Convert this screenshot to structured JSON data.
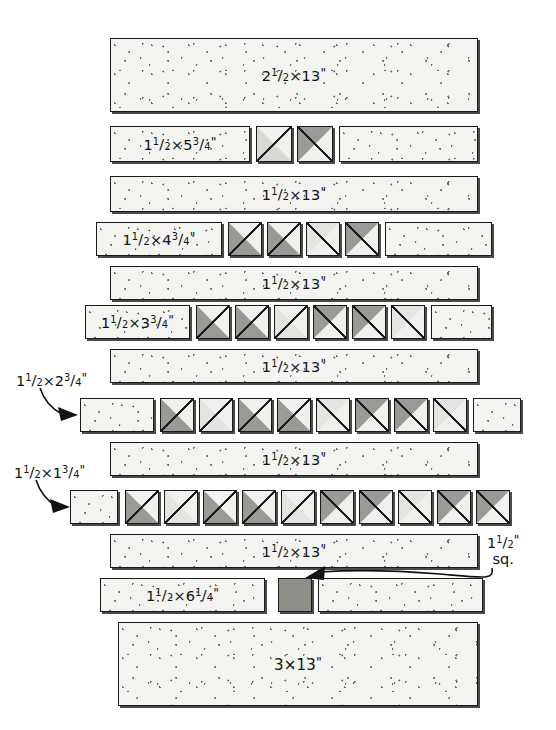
{
  "diagram": {
    "colors": {
      "fabric_light": "#f3f3f0",
      "triangle_light": "#d9d9d4",
      "triangle_dark": "#9a9a95",
      "solid_square": "#8f8f8a",
      "outline": "#1a1a1a"
    },
    "rows": [
      {
        "id": "row-1",
        "pieces": [
          {
            "type": "strip",
            "label": "2½×13\"",
            "label_parts": {
              "whole": "2",
              "num": "1",
              "den": "2",
              "rest": "×13",
              "inch": "\""
            }
          }
        ]
      },
      {
        "id": "row-2",
        "pieces": [
          {
            "type": "strip",
            "label": "1½×5¾\"",
            "label_parts": {
              "whole": "1",
              "num": "1",
              "den": "2",
              "rest": "×5",
              "num2": "3",
              "den2": "4",
              "inch": "\""
            }
          },
          {
            "type": "hst",
            "shade": "light",
            "orientation": "lower-left"
          },
          {
            "type": "hst",
            "shade": "dark",
            "orientation": "upper-left"
          },
          {
            "type": "strip",
            "label": ""
          }
        ]
      },
      {
        "id": "row-3",
        "pieces": [
          {
            "type": "strip",
            "label": "1½×13\"",
            "label_parts": {
              "whole": "1",
              "num": "1",
              "den": "2",
              "rest": "×13",
              "inch": "\""
            }
          }
        ]
      },
      {
        "id": "row-4",
        "pieces": [
          {
            "type": "strip",
            "label": "1½×4¾\"",
            "label_parts": {
              "whole": "1",
              "num": "1",
              "den": "2",
              "rest": "×4",
              "num2": "3",
              "den2": "4",
              "inch": "\""
            }
          },
          {
            "type": "hst",
            "shade": "dark",
            "orientation": "lower-left"
          },
          {
            "type": "hst",
            "shade": "dark",
            "orientation": "lower-left"
          },
          {
            "type": "hst",
            "shade": "light",
            "orientation": "upper-left"
          },
          {
            "type": "hst",
            "shade": "dark",
            "orientation": "upper-left"
          },
          {
            "type": "strip",
            "label": ""
          }
        ]
      },
      {
        "id": "row-5",
        "pieces": [
          {
            "type": "strip",
            "label": "1½×13\"",
            "label_parts": {
              "whole": "1",
              "num": "1",
              "den": "2",
              "rest": "×13",
              "inch": "\""
            }
          }
        ]
      },
      {
        "id": "row-6",
        "pieces": [
          {
            "type": "strip",
            "label": "1½×3¾\"",
            "label_parts": {
              "whole": "1",
              "num": "1",
              "den": "2",
              "rest": "×3",
              "num2": "3",
              "den2": "4",
              "inch": "\""
            }
          },
          {
            "type": "hst",
            "shade": "dark",
            "orientation": "lower-left"
          },
          {
            "type": "hst",
            "shade": "dark",
            "orientation": "lower-left"
          },
          {
            "type": "hst",
            "shade": "light",
            "orientation": "lower-left"
          },
          {
            "type": "hst",
            "shade": "dark",
            "orientation": "upper-left"
          },
          {
            "type": "hst",
            "shade": "dark",
            "orientation": "upper-left"
          },
          {
            "type": "hst",
            "shade": "light",
            "orientation": "upper-left"
          },
          {
            "type": "strip",
            "label": ""
          }
        ]
      },
      {
        "id": "row-7",
        "pieces": [
          {
            "type": "strip",
            "label": "1½×13\"",
            "label_parts": {
              "whole": "1",
              "num": "1",
              "den": "2",
              "rest": "×13",
              "inch": "\""
            }
          }
        ]
      },
      {
        "id": "row-8",
        "callout_left": "1½×2¾\"",
        "pieces": [
          {
            "type": "strip",
            "label": ""
          },
          {
            "type": "hst",
            "shade": "dark",
            "orientation": "lower-left"
          },
          {
            "type": "hst",
            "shade": "light",
            "orientation": "lower-left"
          },
          {
            "type": "hst",
            "shade": "dark",
            "orientation": "lower-left"
          },
          {
            "type": "hst",
            "shade": "dark",
            "orientation": "lower-left"
          },
          {
            "type": "hst",
            "shade": "light",
            "orientation": "upper-left"
          },
          {
            "type": "hst",
            "shade": "dark",
            "orientation": "upper-left"
          },
          {
            "type": "hst",
            "shade": "dark",
            "orientation": "upper-left"
          },
          {
            "type": "hst",
            "shade": "light",
            "orientation": "upper-left"
          },
          {
            "type": "strip",
            "label": ""
          }
        ]
      },
      {
        "id": "row-9",
        "pieces": [
          {
            "type": "strip",
            "label": "1½×13\"",
            "label_parts": {
              "whole": "1",
              "num": "1",
              "den": "2",
              "rest": "×13",
              "inch": "\""
            }
          }
        ]
      },
      {
        "id": "row-10",
        "callout_left": "1½×1¾\"",
        "pieces": [
          {
            "type": "strip",
            "label": ""
          },
          {
            "type": "hst",
            "shade": "dark",
            "orientation": "lower-left"
          },
          {
            "type": "hst",
            "shade": "light",
            "orientation": "lower-left"
          },
          {
            "type": "hst",
            "shade": "dark",
            "orientation": "lower-left"
          },
          {
            "type": "hst",
            "shade": "dark",
            "orientation": "lower-left"
          },
          {
            "type": "hst",
            "shade": "light",
            "orientation": "lower-left"
          },
          {
            "type": "hst",
            "shade": "dark",
            "orientation": "upper-left"
          },
          {
            "type": "hst",
            "shade": "dark",
            "orientation": "upper-left"
          },
          {
            "type": "hst",
            "shade": "light",
            "orientation": "upper-left"
          },
          {
            "type": "hst",
            "shade": "dark",
            "orientation": "upper-left"
          },
          {
            "type": "hst",
            "shade": "dark",
            "orientation": "upper-left"
          },
          {
            "type": "strip",
            "label": ""
          }
        ]
      },
      {
        "id": "row-11",
        "pieces": [
          {
            "type": "strip",
            "label": "1½×13\"",
            "label_parts": {
              "whole": "1",
              "num": "1",
              "den": "2",
              "rest": "×13",
              "inch": "\""
            }
          }
        ]
      },
      {
        "id": "row-12",
        "callout_right_line1": "1½\"",
        "callout_right_line2": "sq.",
        "pieces": [
          {
            "type": "strip",
            "label": "1½×6¼\"",
            "label_parts": {
              "whole": "1",
              "num": "1",
              "den": "2",
              "rest": "×6",
              "num2": "1",
              "den2": "4",
              "inch": "\""
            }
          },
          {
            "type": "solid_square",
            "label": ""
          },
          {
            "type": "strip",
            "label": ""
          }
        ]
      },
      {
        "id": "row-13",
        "pieces": [
          {
            "type": "strip",
            "label": "3×13\"",
            "label_parts": {
              "whole": "3×13",
              "inch": "\""
            }
          }
        ]
      }
    ],
    "labels": {
      "r1": {
        "whole": "2",
        "num": "1",
        "den": "2",
        "rest": "×13",
        "inch": "\""
      },
      "r2": {
        "whole": "1",
        "num": "1",
        "den": "2",
        "rest": "×5",
        "num2": "3",
        "den2": "4",
        "inch": "\""
      },
      "r3": {
        "whole": "1",
        "num": "1",
        "den": "2",
        "rest": "×13",
        "inch": "\""
      },
      "r4": {
        "whole": "1",
        "num": "1",
        "den": "2",
        "rest": "×4",
        "num2": "3",
        "den2": "4",
        "inch": "\""
      },
      "r5": {
        "whole": "1",
        "num": "1",
        "den": "2",
        "rest": "×13",
        "inch": "\""
      },
      "r6": {
        "whole": "1",
        "num": "1",
        "den": "2",
        "rest": "×3",
        "num2": "3",
        "den2": "4",
        "inch": "\""
      },
      "r7": {
        "whole": "1",
        "num": "1",
        "den": "2",
        "rest": "×13",
        "inch": "\""
      },
      "r8": {
        "whole": "1",
        "num": "1",
        "den": "2",
        "rest": "×2",
        "num2": "3",
        "den2": "4",
        "inch": "\""
      },
      "r9": {
        "whole": "1",
        "num": "1",
        "den": "2",
        "rest": "×13",
        "inch": "\""
      },
      "r10": {
        "whole": "1",
        "num": "1",
        "den": "2",
        "rest": "×1",
        "num2": "3",
        "den2": "4",
        "inch": "\""
      },
      "r11": {
        "whole": "1",
        "num": "1",
        "den": "2",
        "rest": "×13",
        "inch": "\""
      },
      "r12": {
        "whole": "1",
        "num": "1",
        "den": "2",
        "rest": "×6",
        "num2": "1",
        "den2": "4",
        "inch": "\""
      },
      "r12sq": {
        "whole": "1",
        "num": "1",
        "den": "2",
        "inch": "\"",
        "second": "sq."
      },
      "r13": {
        "whole": "3×13",
        "inch": "\""
      }
    }
  }
}
